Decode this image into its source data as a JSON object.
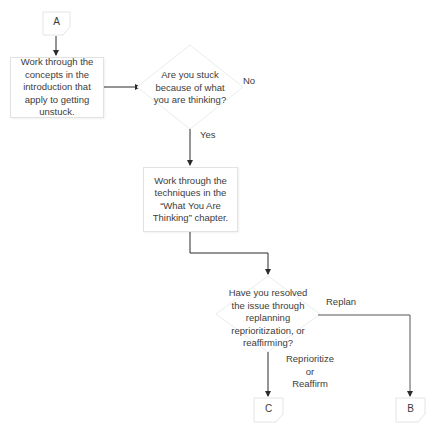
{
  "connectors": {
    "start": "A",
    "end_left": "C",
    "end_right": "B"
  },
  "steps": {
    "intro": "Work through the concepts in the introduction that apply to getting unstuck.",
    "techniques": "Work through the techniques in the “What You Are Thinking” chapter."
  },
  "decisions": {
    "stuck": "Are you stuck because of what you are thinking?",
    "resolved": "Have you resolved the issue through replanning reprioritization, or reaffirming?"
  },
  "edge_labels": {
    "no": "No",
    "yes": "Yes",
    "replan": "Replan",
    "reprioritize_1": "Reprioritize",
    "reprioritize_2": "or",
    "reprioritize_3": "Reaffirm"
  },
  "colors": {
    "line": "#2b2b2b",
    "shape_border": "#e2e2e2",
    "text": "#3c3c3c"
  }
}
